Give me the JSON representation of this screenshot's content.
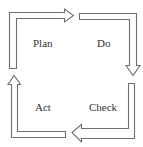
{
  "diagram": {
    "type": "cycle",
    "title": "",
    "stages": [
      {
        "id": "plan",
        "label": "Plan",
        "position": "top-left",
        "arrow_direction": "right"
      },
      {
        "id": "do",
        "label": "Do",
        "position": "top-right",
        "arrow_direction": "down"
      },
      {
        "id": "check",
        "label": "Check",
        "position": "bottom-right",
        "arrow_direction": "left"
      },
      {
        "id": "act",
        "label": "Act",
        "position": "bottom-left",
        "arrow_direction": "up"
      }
    ],
    "colors": {
      "arrow_stroke": "#6e6e6e",
      "arrow_fill": "#ffffff",
      "text": "#333333",
      "background": "#ffffff"
    }
  }
}
